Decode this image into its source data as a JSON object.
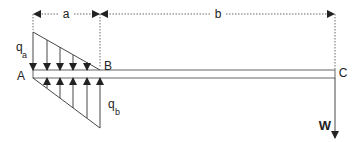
{
  "diagram": {
    "labels": {
      "a": "a",
      "b": "b",
      "A": "A",
      "B": "B",
      "C": "C",
      "qa_main": "q",
      "qa_sub": "a",
      "qb_main": "q",
      "qb_sub": "b",
      "W": "W"
    },
    "colors": {
      "line": "#333333",
      "background": "#ffffff"
    }
  }
}
